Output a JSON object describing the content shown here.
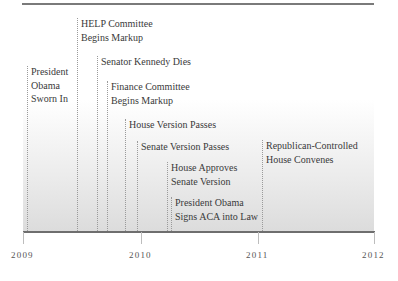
{
  "timeline": {
    "axis": {
      "years": [
        {
          "label": "2009",
          "x": 23
        },
        {
          "label": "2010",
          "x": 141
        },
        {
          "label": "2011",
          "x": 258
        },
        {
          "label": "2012",
          "x": 374
        }
      ]
    },
    "events": [
      {
        "lines": [
          "President",
          "Obama",
          "Sworn In"
        ],
        "x": 27,
        "top": 65
      },
      {
        "lines": [
          "HELP Committee",
          "Begins Markup"
        ],
        "x": 77,
        "top": 17
      },
      {
        "lines": [
          "Senator Kennedy Dies"
        ],
        "x": 97,
        "top": 55
      },
      {
        "lines": [
          "Finance Committee",
          "Begins Markup"
        ],
        "x": 107,
        "top": 80
      },
      {
        "lines": [
          "House Version Passes"
        ],
        "x": 125,
        "top": 118
      },
      {
        "lines": [
          "Senate Version Passes"
        ],
        "x": 137,
        "top": 140
      },
      {
        "lines": [
          "House Approves",
          "Senate Version"
        ],
        "x": 167,
        "top": 161
      },
      {
        "lines": [
          "President Obama",
          "Signs ACA into Law"
        ],
        "x": 171,
        "top": 196
      },
      {
        "lines": [
          "Republican-Controlled",
          "House Convenes"
        ],
        "x": 262,
        "top": 139
      }
    ]
  }
}
